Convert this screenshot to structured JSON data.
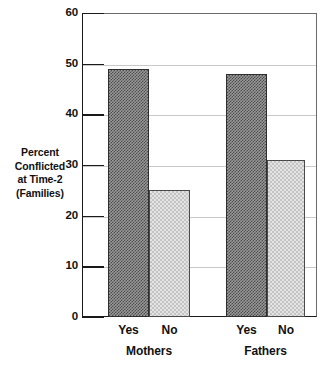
{
  "chart_data": {
    "type": "bar",
    "title": "",
    "xlabel": "",
    "ylabel": "Percent Conflicted at Time-2 (Families)",
    "ylabel_lines": [
      "Percent",
      "Conflicted",
      "at Time-2",
      "(Families)"
    ],
    "ylim": [
      0,
      60
    ],
    "yticks": [
      0,
      10,
      20,
      30,
      40,
      50,
      60
    ],
    "ytick_labels": [
      "0",
      "10",
      "20",
      "30",
      "40",
      "50",
      "60"
    ],
    "grid": true,
    "legend": "none",
    "categories": [
      "Yes",
      "No"
    ],
    "groups": [
      "Mothers",
      "Fathers"
    ],
    "series": [
      {
        "name": "Yes",
        "fill": "dark-hatch",
        "values": [
          49,
          48
        ]
      },
      {
        "name": "No",
        "fill": "light-hatch",
        "values": [
          25,
          31
        ]
      }
    ],
    "bars": [
      {
        "group": "Mothers",
        "category": "Yes",
        "value": 49,
        "fill": "dark-hatch"
      },
      {
        "group": "Mothers",
        "category": "No",
        "value": 25,
        "fill": "light-hatch"
      },
      {
        "group": "Fathers",
        "category": "Yes",
        "value": 48,
        "fill": "dark-hatch"
      },
      {
        "group": "Fathers",
        "category": "No",
        "value": 31,
        "fill": "light-hatch"
      }
    ],
    "colors": {
      "dark_fill": "#4a4a4a",
      "light_fill": "#c4c4c4",
      "axis": "#1a1a1a",
      "grid": "#c9c9c9",
      "background": "#ffffff"
    }
  }
}
